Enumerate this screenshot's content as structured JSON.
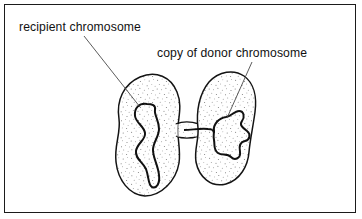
{
  "figure": {
    "background": "#ffffff",
    "frame_color": "#1b1b1b",
    "ink_color": "#111111",
    "stipple_color": "#6f6f6f",
    "labels": {
      "recipient": "recipient chromosome",
      "donor": "copy of donor chromosome"
    },
    "parts": [
      {
        "name": "recipient-cell",
        "description": "left stippled bacterial cell"
      },
      {
        "name": "donor-cell",
        "description": "right stippled bacterial cell"
      },
      {
        "name": "conjugation-bridge",
        "description": "narrow tube joining the two cells"
      },
      {
        "name": "recipient-chromosome",
        "description": "elongated wavy chromosome in left cell"
      },
      {
        "name": "donor-chromosome-copy",
        "description": "compact closed loop in right cell"
      },
      {
        "name": "leader-line-recipient",
        "description": "pointer from left label to left chromosome"
      },
      {
        "name": "leader-line-donor",
        "description": "pointer from right label to right chromosome"
      }
    ]
  }
}
